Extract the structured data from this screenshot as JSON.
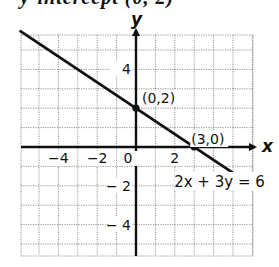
{
  "top_fragment": "y-intercept (0, 2)",
  "chart_data": {
    "type": "line",
    "title": "",
    "xlabel": "x",
    "ylabel": "y",
    "xlim": [
      -6,
      6
    ],
    "ylim": [
      -5.6,
      5.8
    ],
    "grid": true,
    "grid_style": "dotted",
    "x_ticks": [
      {
        "value": -4,
        "label": "−4"
      },
      {
        "value": -2,
        "label": "−2"
      },
      {
        "value": 0,
        "label": "0"
      },
      {
        "value": 2,
        "label": "2"
      }
    ],
    "y_ticks": [
      {
        "value": 4,
        "label": "4"
      },
      {
        "value": -2,
        "label": "− 2"
      },
      {
        "value": -4,
        "label": "− 4"
      }
    ],
    "series": [
      {
        "name": "2x + 3y = 6",
        "equation": "2x + 3y = 6",
        "slope": -0.6667,
        "intercept": 2,
        "x": [
          -6,
          6
        ],
        "y": [
          6,
          -2
        ],
        "color": "#111111"
      }
    ],
    "points": [
      {
        "x": 0,
        "y": 2,
        "label": "(0,2)"
      },
      {
        "x": 3,
        "y": 0,
        "label": "(3,0)"
      }
    ],
    "annotations": [
      {
        "text": "2x + 3y = 6",
        "at_x": 4.2,
        "at_y": -1.75
      }
    ]
  }
}
